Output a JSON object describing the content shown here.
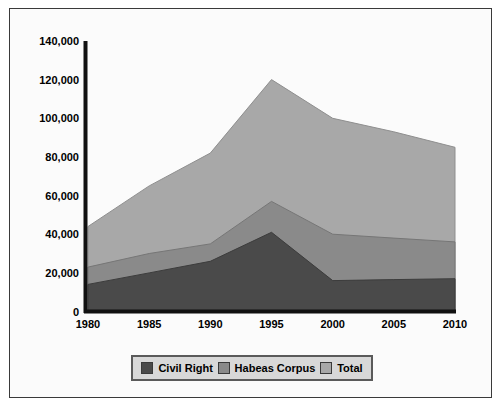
{
  "chart_data": {
    "type": "area",
    "title": "",
    "subtitle": "",
    "xlabel": "",
    "ylabel": "",
    "categories": [
      "1980",
      "1985",
      "1990",
      "1995",
      "2000",
      "2005",
      "2010"
    ],
    "x": [
      1980,
      1985,
      1990,
      1995,
      2000,
      2005,
      2010
    ],
    "xlim": [
      1980,
      2010
    ],
    "ylim": [
      0,
      140000
    ],
    "ytick_labels": [
      "0",
      "20,000",
      "40,000",
      "60,000",
      "80,000",
      "100,000",
      "120,000",
      "140,000"
    ],
    "ytick_values": [
      0,
      20000,
      40000,
      60000,
      80000,
      100000,
      120000,
      140000
    ],
    "grid": false,
    "legend_position": "bottom",
    "stacked_appearance": true,
    "series": [
      {
        "name": "Civil Right",
        "color": "#4a4a4a",
        "values": [
          14000,
          20000,
          26000,
          41000,
          16000,
          16500,
          17000
        ]
      },
      {
        "name": "Habeas Corpus",
        "color": "#8a8a8a",
        "values": [
          23000,
          30000,
          35000,
          57000,
          40000,
          38000,
          36000
        ]
      },
      {
        "name": "Total",
        "color": "#a8a8a8",
        "values": [
          44000,
          65000,
          82000,
          120000,
          100000,
          93000,
          85000
        ]
      }
    ]
  },
  "legend": {
    "items": [
      {
        "label": "Civil Right",
        "color": "#4a4a4a"
      },
      {
        "label": "Habeas Corpus",
        "color": "#8a8a8a"
      },
      {
        "label": "Total",
        "color": "#a8a8a8"
      }
    ]
  },
  "axes": {
    "y_labels": [
      "140,000",
      "120,000",
      "100,000",
      "80,000",
      "60,000",
      "40,000",
      "20,000",
      "0"
    ],
    "x_labels": [
      "1980",
      "1985",
      "1990",
      "1995",
      "2000",
      "2005",
      "2010"
    ]
  },
  "colors": {
    "axis": "#111111",
    "frame": "#3a3a3a",
    "background": "#fbfbfb",
    "civil_right": "#4a4a4a",
    "habeas_corpus": "#8a8a8a",
    "total": "#a8a8a8"
  }
}
